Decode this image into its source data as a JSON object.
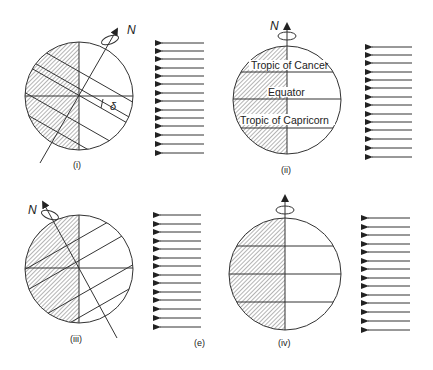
{
  "figure_label": "(e)",
  "panels": [
    {
      "id": "i",
      "label": "(i)",
      "pole_label": "N",
      "angle_label": "δ",
      "axis_tilt": "toward sun"
    },
    {
      "id": "ii",
      "label": "(ii)",
      "pole_label": "N",
      "latitude_labels": [
        "Tropic of Cancer",
        "Equator",
        "Tropic of Capricorn"
      ]
    },
    {
      "id": "iii",
      "label": "(iii)",
      "pole_label": "N",
      "axis_tilt": "away from sun"
    },
    {
      "id": "iv",
      "label": "(iv)",
      "pole_label": ""
    }
  ],
  "sun_rays": {
    "count_per_panel": 14,
    "direction": "leftward"
  },
  "colors": {
    "line": "#333333",
    "hatch": "#777777",
    "background": "#ffffff"
  }
}
